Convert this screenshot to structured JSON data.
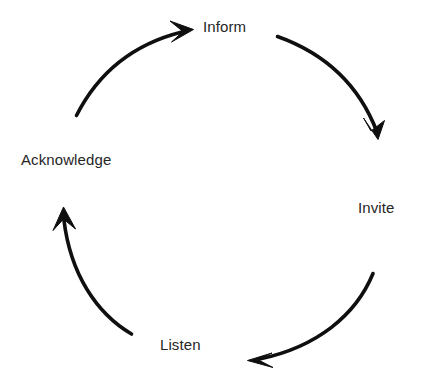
{
  "diagram": {
    "type": "cycle",
    "title": "",
    "background_color": "#ffffff",
    "stroke_color": "#0f0f0f",
    "text_color": "#262626",
    "direction": "clockwise",
    "center": {
      "x": 220,
      "y": 190
    },
    "radius": 155,
    "nodes": [
      {
        "id": "inform",
        "label": "Inform",
        "position": "top",
        "angle_deg": 270
      },
      {
        "id": "invite",
        "label": "Invite",
        "position": "right",
        "angle_deg": 0
      },
      {
        "id": "listen",
        "label": "Listen",
        "position": "bottom",
        "angle_deg": 90
      },
      {
        "id": "acknowledge",
        "label": "Acknowledge",
        "position": "left",
        "angle_deg": 180
      }
    ],
    "arrows": [
      {
        "id": "inform-to-invite",
        "from": "inform",
        "to": "invite",
        "quadrant": "top-right",
        "path": "M 277.5 36.5 C 321 52 358 82 377 132",
        "head_points": "378,139.5 363.5,118 371,131 384.5,120.5",
        "stroke_width": 3.6
      },
      {
        "id": "invite-to-listen",
        "from": "invite",
        "to": "listen",
        "quadrant": "bottom-right",
        "path": "M 373 273.5 C 356 315 317 347 259.5 359",
        "head_points": "247.5,360.5 272,353 257.5,359.5 273,367.5",
        "stroke_width": 3.6
      },
      {
        "id": "listen-to-acknowledge",
        "from": "listen",
        "to": "acknowledge",
        "quadrant": "bottom-left",
        "path": "M 131.5 334 C 96 313 70.5 273.5 64 220.5",
        "head_points": "63.5,207 53,230.5 63.5,219 75.5,229",
        "stroke_width": 3.6
      },
      {
        "id": "acknowledge-to-inform",
        "from": "acknowledge",
        "to": "inform",
        "quadrant": "top-left",
        "path": "M 76.5 115.5 C 98 73 134 44 182 32",
        "head_points": "193.5,29.5 170,21 183,31.5 171.5,42",
        "stroke_width": 3.6
      }
    ]
  }
}
